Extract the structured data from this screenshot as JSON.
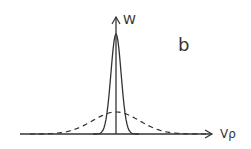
{
  "diagram": {
    "panel_label": "b",
    "y_axis_label": "W",
    "x_axis_label": "Vρ",
    "colors": {
      "ink": "#333333",
      "background": "#ffffff"
    },
    "curves": [
      {
        "name": "narrow-peak",
        "style": "solid",
        "relative_height": 1.0,
        "relative_width": 0.12
      },
      {
        "name": "broad-distribution",
        "style": "dashed",
        "relative_height": 0.22,
        "relative_width": 0.55
      }
    ]
  }
}
